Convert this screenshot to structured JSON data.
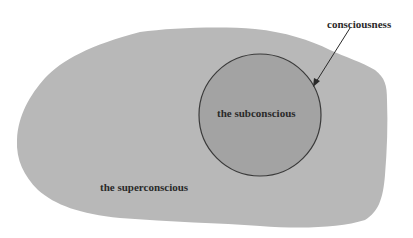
{
  "diagram": {
    "labels": {
      "consciousness": "consciousness",
      "subconscious": "the subconscious",
      "superconscious": "the superconscious"
    },
    "colors": {
      "background": "#ffffff",
      "blob_fill": "#b8b8b8",
      "circle_fill": "#a3a3a3",
      "circle_stroke": "#3a3a3a",
      "text": "#2a2a2a",
      "arrow": "#2a2a2a"
    }
  }
}
